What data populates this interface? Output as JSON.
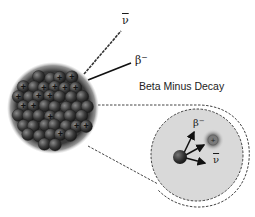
{
  "diagram": {
    "title": "Beta Minus Decay",
    "labels": {
      "antineutrino_symbol": "ν",
      "beta_symbol": "β",
      "beta_charge": "−"
    },
    "nucleus": {
      "description": "nucleus of protons and neutrons",
      "proton_sign": "+"
    },
    "inset": {
      "description": "magnified view of neutron decaying",
      "particles": [
        "neutron",
        "proton",
        "beta-minus electron",
        "antineutrino"
      ],
      "proton_sign": "+"
    },
    "colors": {
      "nucleus_dark": "#2b2b2b",
      "nucleus_light": "#6a6a6a",
      "inset_fill": "#d9d9d9",
      "dashed_line": "#444444",
      "text": "#1a1a1a"
    }
  }
}
